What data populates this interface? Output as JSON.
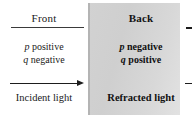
{
  "figure": {
    "type": "optics-sign-convention-diagram",
    "panel_color_front": "#ffffff",
    "panel_color_back": "#d4d4d4"
  },
  "front": {
    "header": "Front",
    "sign_p": "p positive",
    "sign_q": "q negative",
    "p_symbol": "p",
    "p_value": " positive",
    "q_symbol": "q",
    "q_value": " negative",
    "caption": "Incident light",
    "arrow": "right-arrow"
  },
  "back": {
    "header": "Back",
    "sign_p": "p negative",
    "sign_q": "q positive",
    "p_symbol": "p",
    "p_value": " negative",
    "q_symbol": "q",
    "q_value": " positive",
    "caption": "Refracted light",
    "arrow": "right-arrow"
  }
}
